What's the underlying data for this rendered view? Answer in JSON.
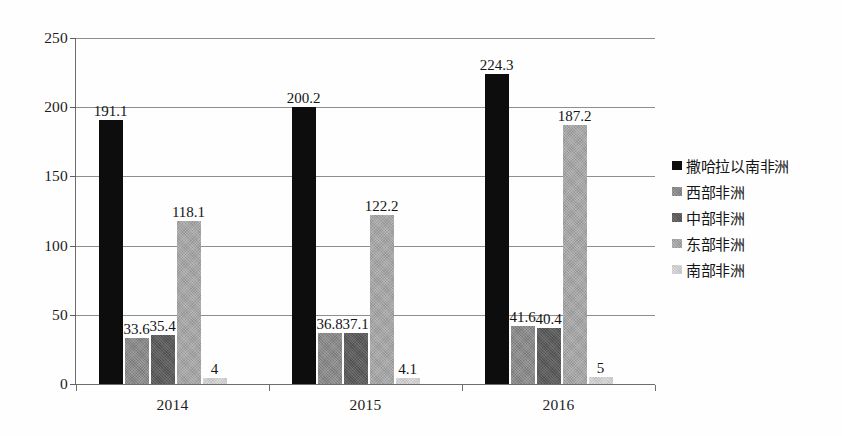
{
  "chart_data": {
    "type": "bar",
    "title": "",
    "subtitle": "",
    "xlabel": "",
    "ylabel": "",
    "categories": [
      "2014",
      "2015",
      "2016"
    ],
    "series": [
      {
        "name": "撒哈拉以南非洲",
        "color": "#0d0d0d",
        "values": [
          191.1,
          200.2,
          224.3
        ],
        "labels": [
          "191.1",
          "200.2",
          "224.3"
        ]
      },
      {
        "name": "西部非洲",
        "color": "#8a8a8a",
        "values": [
          33.6,
          36.8,
          41.6
        ],
        "labels": [
          "33.6",
          "36.8",
          "41.6"
        ]
      },
      {
        "name": "中部非洲",
        "color": "#5b5b5b",
        "values": [
          35.4,
          37.1,
          40.4
        ],
        "labels": [
          "35.4",
          "37.1",
          "40.4"
        ]
      },
      {
        "name": "东部非洲",
        "color": "#a6a6a6",
        "values": [
          118.1,
          122.2,
          187.2
        ],
        "labels": [
          "118.1",
          "122.2",
          "187.2"
        ]
      },
      {
        "name": "南部非洲",
        "color": "#cfcfcf",
        "values": [
          4,
          4.1,
          5
        ],
        "labels": [
          "4",
          "4.1",
          "5"
        ]
      }
    ],
    "ylim": [
      0,
      250
    ],
    "yticks": [
      0,
      50,
      100,
      150,
      200,
      250
    ],
    "ytick_labels": [
      "0",
      "50",
      "100",
      "150",
      "200",
      "250"
    ],
    "grid": true,
    "grid_axis": "y",
    "legend_position": "right",
    "data_labels": true
  },
  "legend": {
    "items": [
      {
        "label": "撒哈拉以南非洲",
        "swatch": "#0d0d0d"
      },
      {
        "label": "西部非洲",
        "swatch": "#8a8a8a"
      },
      {
        "label": "中部非洲",
        "swatch": "#5b5b5b"
      },
      {
        "label": "东部非洲",
        "swatch": "#a6a6a6"
      },
      {
        "label": "南部非洲",
        "swatch": "#cfcfcf"
      }
    ]
  }
}
